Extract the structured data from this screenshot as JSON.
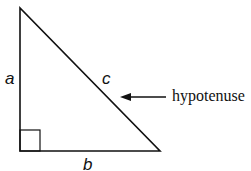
{
  "diagram": {
    "labels": {
      "side_a": "a",
      "side_b": "b",
      "side_c": "c",
      "annotation": "hypotenuse"
    },
    "colors": {
      "stroke": "#111111",
      "background": "#ffffff"
    }
  }
}
